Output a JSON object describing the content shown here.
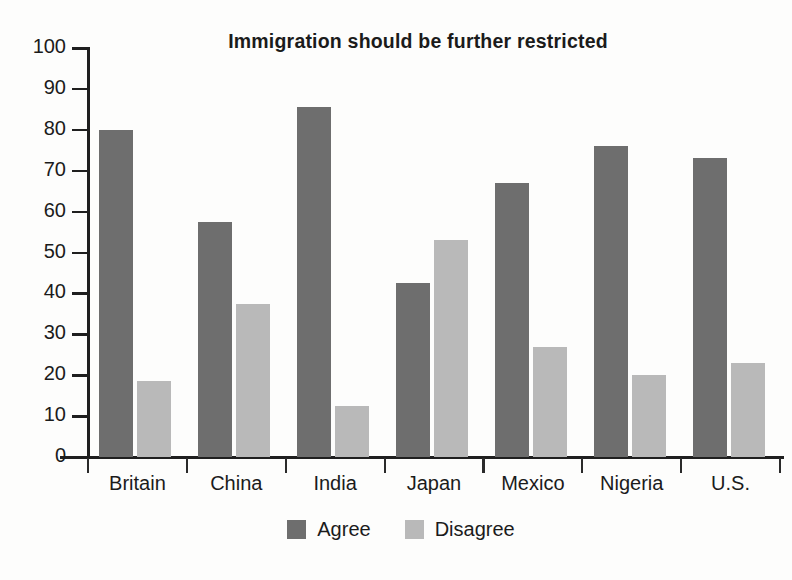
{
  "chart_data": {
    "type": "bar",
    "title": "Immigration should be further restricted",
    "xlabel": "",
    "ylabel": "",
    "ylim": [
      0,
      100
    ],
    "yticks": [
      0,
      10,
      20,
      30,
      40,
      50,
      60,
      70,
      80,
      90,
      100
    ],
    "grid": false,
    "legend_position": "bottom-center",
    "categories": [
      "Britain",
      "China",
      "India",
      "Japan",
      "Mexico",
      "Nigeria",
      "U.S."
    ],
    "series": [
      {
        "name": "Agree",
        "color": "#6e6e6e",
        "values": [
          80,
          57.5,
          85.5,
          42.5,
          67,
          76,
          73
        ]
      },
      {
        "name": "Disagree",
        "color": "#b9b9b9",
        "values": [
          18.5,
          37.5,
          12.5,
          53,
          27,
          20,
          23
        ]
      }
    ]
  },
  "legend": {
    "entries": [
      {
        "label": "Agree"
      },
      {
        "label": "Disagree"
      }
    ]
  },
  "colors": {
    "agree": "#6e6e6e",
    "disagree": "#b9b9b9",
    "axis": "#1f1f1f",
    "text": "#1b1b1b",
    "background": "#fdfdfc"
  }
}
